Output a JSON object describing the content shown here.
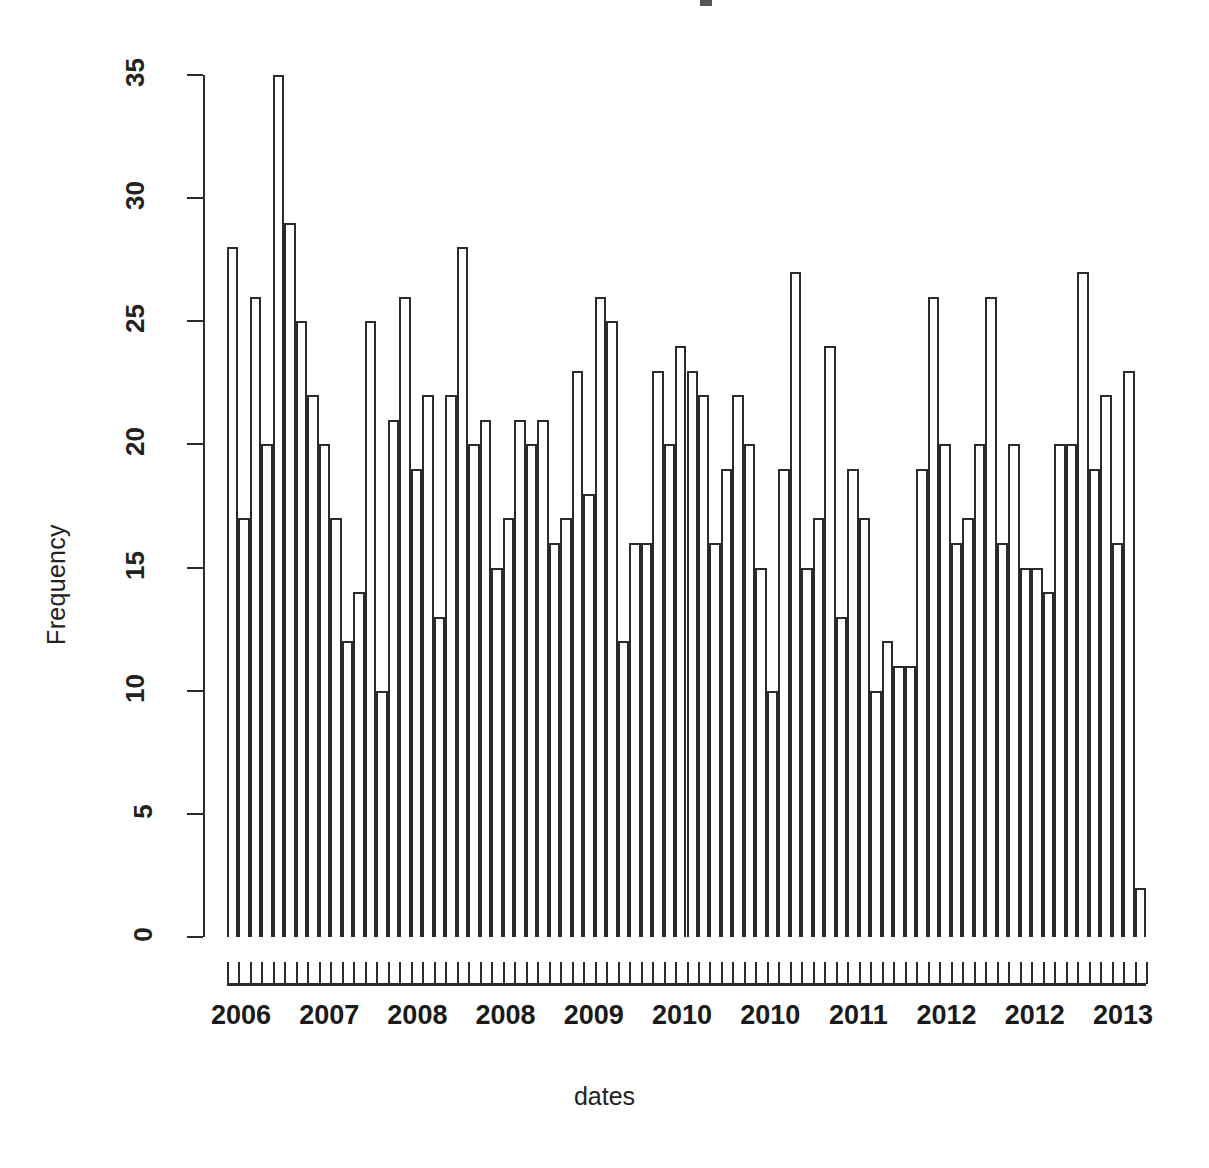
{
  "chart_data": {
    "type": "bar",
    "title": "",
    "xlabel": "dates",
    "ylabel": "Frequency",
    "ylim": [
      0,
      35
    ],
    "yticks": [
      0,
      5,
      10,
      15,
      20,
      25,
      30,
      35
    ],
    "xtick_labels": [
      "2006",
      "2007",
      "2008",
      "2008",
      "2009",
      "2010",
      "2010",
      "2011",
      "2012",
      "2012",
      "2013"
    ],
    "grid": false,
    "legend": null,
    "bar_style": "hollow-outline histogram (R hist of dates)",
    "n_bars": 80,
    "values": [
      28,
      17,
      26,
      20,
      35,
      29,
      25,
      22,
      20,
      17,
      12,
      14,
      25,
      10,
      21,
      26,
      19,
      22,
      13,
      22,
      28,
      20,
      21,
      15,
      17,
      21,
      20,
      21,
      16,
      17,
      23,
      18,
      26,
      25,
      12,
      16,
      16,
      23,
      20,
      24,
      23,
      22,
      16,
      19,
      22,
      20,
      15,
      10,
      19,
      27,
      15,
      17,
      24,
      13,
      19,
      17,
      10,
      12,
      11,
      11,
      19,
      26,
      20,
      16,
      17,
      20,
      26,
      16,
      20,
      15,
      15,
      14,
      20,
      20,
      27,
      19,
      22,
      16,
      23,
      2
    ]
  },
  "axis": {
    "y_title": "Frequency",
    "x_title": "dates"
  }
}
